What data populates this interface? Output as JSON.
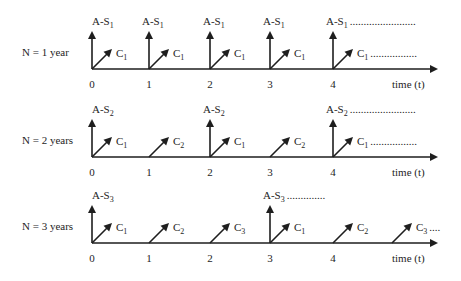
{
  "figure": {
    "axis_label": "time (t)",
    "rows": [
      {
        "label": "N = 1 year",
        "ticks": [
          "0",
          "1",
          "2",
          "3",
          "4"
        ],
        "vertical_arrows": [
          {
            "t": 0,
            "label": "A-S",
            "sub": "1",
            "trail": ""
          },
          {
            "t": 1,
            "label": "A-S",
            "sub": "1",
            "trail": ""
          },
          {
            "t": 2,
            "label": "A-S",
            "sub": "1",
            "trail": ""
          },
          {
            "t": 3,
            "label": "A-S",
            "sub": "1",
            "trail": ""
          },
          {
            "t": 4,
            "label": "A-S",
            "sub": "1",
            "trail": "........................"
          }
        ],
        "diagonal_arrows": [
          {
            "t": 0,
            "label": "C",
            "sub": "1",
            "trail": ""
          },
          {
            "t": 1,
            "label": "C",
            "sub": "1",
            "trail": ""
          },
          {
            "t": 2,
            "label": "C",
            "sub": "1",
            "trail": ""
          },
          {
            "t": 3,
            "label": "C",
            "sub": "1",
            "trail": ""
          },
          {
            "t": 4,
            "label": "C",
            "sub": "1",
            "trail": "................."
          }
        ]
      },
      {
        "label": "N = 2 years",
        "ticks": [
          "0",
          "1",
          "2",
          "3",
          "4"
        ],
        "vertical_arrows": [
          {
            "t": 0,
            "label": "A-S",
            "sub": "2",
            "trail": ""
          },
          {
            "t": 2,
            "label": "A-S",
            "sub": "2",
            "trail": ""
          },
          {
            "t": 4,
            "label": "A-S",
            "sub": "2",
            "trail": "........................"
          }
        ],
        "diagonal_arrows": [
          {
            "t": 0,
            "label": "C",
            "sub": "1",
            "trail": ""
          },
          {
            "t": 1,
            "label": "C",
            "sub": "2",
            "trail": ""
          },
          {
            "t": 2,
            "label": "C",
            "sub": "1",
            "trail": ""
          },
          {
            "t": 3,
            "label": "C",
            "sub": "2",
            "trail": ""
          },
          {
            "t": 4,
            "label": "C",
            "sub": "1",
            "trail": "................."
          }
        ]
      },
      {
        "label": "N = 3 years",
        "ticks": [
          "0",
          "1",
          "2",
          "3",
          "4"
        ],
        "vertical_arrows": [
          {
            "t": 0,
            "label": "A-S",
            "sub": "3",
            "trail": ""
          },
          {
            "t": 3,
            "label": "A-S",
            "sub": "3",
            "trail": ".............."
          }
        ],
        "diagonal_arrows": [
          {
            "t": 0,
            "label": "C",
            "sub": "1",
            "trail": ""
          },
          {
            "t": 1,
            "label": "C",
            "sub": "2",
            "trail": ""
          },
          {
            "t": 2,
            "label": "C",
            "sub": "3",
            "trail": ""
          },
          {
            "t": 3,
            "label": "C",
            "sub": "1",
            "trail": ""
          },
          {
            "t": 4,
            "label": "C",
            "sub": "2",
            "trail": ""
          },
          {
            "t": 5,
            "label": "C",
            "sub": "3",
            "trail": "...."
          }
        ]
      }
    ]
  }
}
